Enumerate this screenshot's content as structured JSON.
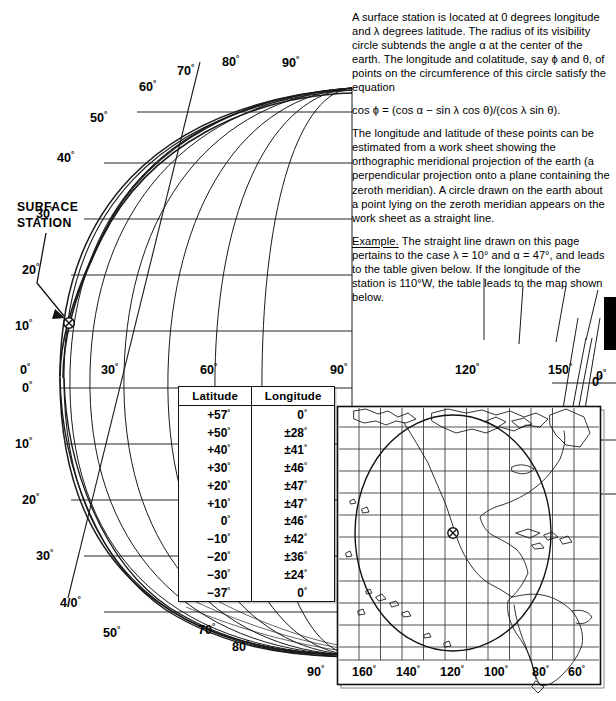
{
  "prose": {
    "p1": "A surface station is located at 0 degrees longitude and λ degrees latitude.  The radius of its visibility circle subtends the angle α at the center of the earth. The longitude and colatitude, say ϕ and θ, of points on the circumference of this circle satisfy the equation",
    "equation": "cos ϕ  =  (cos α − sin λ cos θ)/(cos λ sin θ).",
    "p2": "The longitude and latitude of these points can be estimated from a work sheet showing the orthographic meridional projection of the earth (a perpendicular projection onto a plane containing the zeroth meridian). A circle drawn on the earth about a point lying on the zeroth meridian appears on the work sheet as a straight line.",
    "example_label": "Example.",
    "p3": "  The straight line drawn on this page pertains to the case λ  =  10° and α  =  47°, and leads to the table given below.  If the longitude of the station is 110°W, the table leads to the map shown below."
  },
  "annotation": {
    "surface_station_line1": "SURFACE",
    "surface_station_line2": "STATION"
  },
  "globe": {
    "latitude_labels_left": [
      "0°",
      "10°",
      "20°",
      "30°",
      "40°",
      "50°",
      "60°",
      "70°",
      "80°",
      "90°"
    ],
    "latitude_labels_rim_top": [
      "30°",
      "40°",
      "50°",
      "60°",
      "70°",
      "80°",
      "90°"
    ],
    "latitude_labels_rim_bottom": [
      "30°",
      "40°",
      "50°",
      "70°",
      "80°",
      "90°"
    ],
    "longitude_labels_equator": [
      "0°",
      "30°",
      "60°",
      "90°",
      "120°",
      "150°",
      "0°"
    ],
    "latitude_labels_right": [
      "0°",
      "10°",
      "20°",
      "30°"
    ],
    "station_latitude": "10°",
    "lambda": "10°",
    "alpha": "47°"
  },
  "table": {
    "headers": [
      "Latitude",
      "Longitude"
    ],
    "rows": [
      [
        "+57°",
        "0°"
      ],
      [
        "+50°",
        "±28°"
      ],
      [
        "+40°",
        "±41°"
      ],
      [
        "+30°",
        "±46°"
      ],
      [
        "+20°",
        "±47°"
      ],
      [
        "+10°",
        "±47°"
      ],
      [
        "0°",
        "±46°"
      ],
      [
        "−10°",
        "±42°"
      ],
      [
        "−20°",
        "±36°"
      ],
      [
        "−30°",
        "±24°"
      ],
      [
        "−37°",
        "0°"
      ]
    ]
  },
  "map": {
    "longitude_labels": [
      "160°",
      "140°",
      "120°",
      "100°",
      "80°",
      "60°"
    ],
    "station_longitude": "110°W"
  },
  "chart_data": {
    "type": "line",
    "xlabel": "Longitude (degrees)",
    "ylabel": "Latitude (degrees)",
    "categories": [
      "+57",
      "+50",
      "+40",
      "+30",
      "+20",
      "+10",
      "0",
      "-10",
      "-20",
      "-30",
      "-37"
    ],
    "series": [
      {
        "name": "Longitude extent (± deg) of visibility circle",
        "values": [
          0,
          28,
          41,
          46,
          47,
          47,
          46,
          42,
          36,
          24,
          0
        ]
      }
    ],
    "xlim": [
      0,
      90
    ],
    "ylim": [
      -90,
      90
    ],
    "grid": true,
    "legend": "none",
    "annotations": [
      "SURFACE STATION at 0° longitude, 10° latitude",
      "λ = 10°",
      "α = 47°",
      "station longitude 110°W"
    ]
  }
}
